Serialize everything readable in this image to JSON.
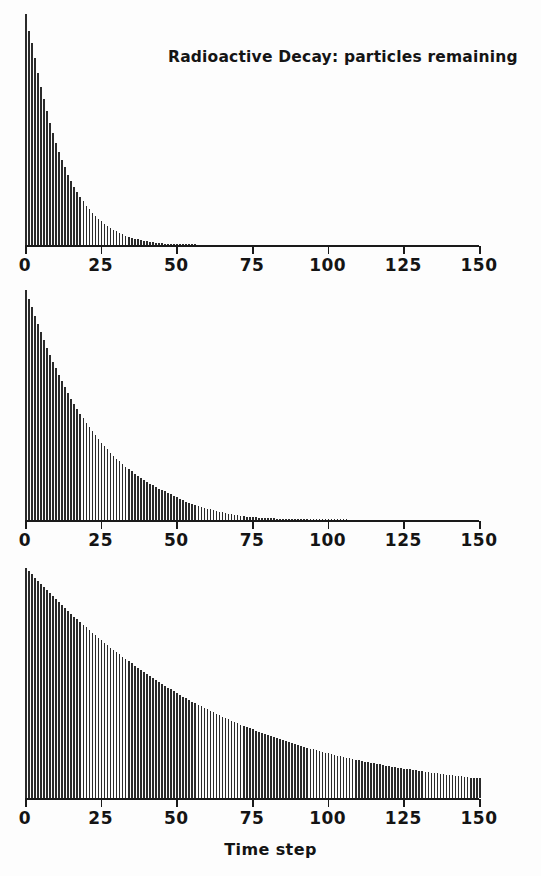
{
  "figure": {
    "title": "Radioactive Decay: particles remaining",
    "xlabel": "Time step",
    "background_color": "#fdfdfd",
    "ink_color": "#2b2b2b"
  },
  "axis": {
    "tick_labels": [
      "0",
      "25",
      "50",
      "75",
      "100",
      "125",
      "150"
    ],
    "tick_values": [
      0,
      25,
      50,
      75,
      100,
      125,
      150
    ]
  },
  "chart_data": {
    "type": "bar",
    "title": "Radioactive Decay: particles remaining",
    "xlabel": "Time step",
    "ylabel": "",
    "xlim": [
      0,
      150
    ],
    "grid": false,
    "legend": "none",
    "note": "Three stacked panels: three independent decay simulations with increasing half-life (fast, medium, slow). Each bar is the particle count remaining at that time step; y axis is unlabelled and each panel is autoscaled to its own initial count.",
    "panels": [
      {
        "name": "panel-fast-decay",
        "ylim": [
          0,
          1000
        ],
        "half_life_steps": 6,
        "x": [
          0,
          1,
          2,
          3,
          4,
          5,
          6,
          7,
          8,
          9,
          10,
          11,
          12,
          13,
          14,
          15,
          16,
          17,
          18,
          19,
          20,
          21,
          22,
          23,
          24,
          25,
          26,
          27,
          28,
          29,
          30,
          31,
          32,
          33,
          34,
          35,
          36,
          37,
          38,
          39,
          40,
          41,
          42,
          43,
          44,
          45,
          46,
          47,
          48,
          49,
          50,
          51,
          52,
          53,
          54,
          55,
          56,
          57,
          58,
          59,
          60,
          61,
          62,
          63,
          64,
          65,
          66,
          67,
          68,
          69,
          70,
          71,
          72,
          73,
          74,
          75,
          76,
          77,
          78,
          79,
          80,
          81,
          82,
          83,
          84,
          85,
          86,
          87,
          88,
          89,
          90,
          91,
          92,
          93,
          94,
          95,
          96,
          97,
          98,
          99,
          100,
          101,
          102,
          103,
          104,
          105,
          106,
          107,
          108,
          109,
          110,
          111,
          112,
          113,
          114,
          115,
          116,
          117,
          118,
          119,
          120,
          121,
          122,
          123,
          124,
          125,
          126,
          127,
          128,
          129,
          130,
          131,
          132,
          133,
          134,
          135,
          136,
          137,
          138,
          139,
          140,
          141,
          142,
          143,
          144,
          145,
          146,
          147,
          148,
          149,
          150
        ],
        "values": [
          1000,
          928,
          874,
          808,
          746,
          683,
          630,
          578,
          529,
          483,
          441,
          404,
          368,
          336,
          305,
          276,
          252,
          229,
          208,
          189,
          171,
          154,
          140,
          126,
          113,
          102,
          92,
          83,
          74,
          66,
          59,
          52,
          46,
          41,
          36,
          32,
          28,
          24,
          21,
          18,
          16,
          13,
          11,
          9,
          8,
          7,
          6,
          5,
          4,
          3,
          3,
          2,
          2,
          1,
          1,
          1,
          1,
          0,
          0,
          0,
          0,
          0,
          0,
          0,
          0,
          0,
          0,
          0,
          0,
          0,
          0,
          0,
          0,
          0,
          0,
          0,
          0,
          0,
          0,
          0,
          0,
          0,
          0,
          0,
          0,
          0,
          0,
          0,
          0,
          0,
          0,
          0,
          0,
          0,
          0,
          0,
          0,
          0,
          0,
          0,
          0,
          0,
          0,
          0,
          0,
          0,
          0,
          0,
          0,
          0,
          0,
          0,
          0,
          0,
          0,
          0,
          0,
          0,
          0,
          0,
          0,
          0,
          0,
          0,
          0,
          0,
          0,
          0,
          0,
          0,
          0,
          0,
          0,
          0,
          0,
          0,
          0,
          0,
          0,
          0,
          0,
          0,
          0,
          0,
          0,
          0
        ]
      },
      {
        "name": "panel-medium-decay",
        "ylim": [
          0,
          1000
        ],
        "half_life_steps": 12,
        "x": [
          0,
          1,
          2,
          3,
          4,
          5,
          6,
          7,
          8,
          9,
          10,
          11,
          12,
          13,
          14,
          15,
          16,
          17,
          18,
          19,
          20,
          21,
          22,
          23,
          24,
          25,
          26,
          27,
          28,
          29,
          30,
          31,
          32,
          33,
          34,
          35,
          36,
          37,
          38,
          39,
          40,
          41,
          42,
          43,
          44,
          45,
          46,
          47,
          48,
          49,
          50,
          51,
          52,
          53,
          54,
          55,
          56,
          57,
          58,
          59,
          60,
          61,
          62,
          63,
          64,
          65,
          66,
          67,
          68,
          69,
          70,
          71,
          72,
          73,
          74,
          75,
          76,
          77,
          78,
          79,
          80,
          81,
          82,
          83,
          84,
          85,
          86,
          87,
          88,
          89,
          90,
          91,
          92,
          93,
          94,
          95,
          96,
          97,
          98,
          99,
          100,
          101,
          102,
          103,
          104,
          105,
          106,
          107,
          108,
          109,
          110,
          111,
          112,
          113,
          114,
          115,
          116,
          117,
          118,
          119,
          120,
          121,
          122,
          123,
          124,
          125,
          126,
          127,
          128,
          129,
          130,
          131,
          132,
          133,
          134,
          135,
          136,
          137,
          138,
          139,
          140,
          141,
          142,
          143,
          144,
          145,
          146,
          147,
          148,
          149,
          150
        ],
        "values": [
          1000,
          962,
          927,
          888,
          852,
          818,
          784,
          750,
          717,
          688,
          660,
          632,
          604,
          578,
          553,
          528,
          506,
          484,
          463,
          442,
          423,
          404,
          386,
          369,
          352,
          336,
          321,
          307,
          293,
          280,
          267,
          255,
          243,
          232,
          221,
          211,
          201,
          192,
          183,
          175,
          166,
          158,
          151,
          144,
          137,
          130,
          124,
          118,
          112,
          106,
          100,
          93,
          86,
          80,
          74,
          69,
          64,
          60,
          56,
          52,
          49,
          46,
          43,
          40,
          37,
          34,
          31,
          28,
          25,
          22,
          20,
          18,
          16,
          14,
          13,
          12,
          11,
          10,
          9,
          8,
          8,
          7,
          7,
          6,
          6,
          5,
          5,
          5,
          4,
          4,
          4,
          3,
          3,
          3,
          3,
          2,
          2,
          2,
          2,
          1,
          1,
          1,
          1,
          1,
          1,
          1,
          1,
          0,
          0,
          0,
          0,
          0,
          0,
          0,
          0,
          0,
          0,
          0,
          0,
          0,
          0,
          0,
          0,
          0,
          0,
          0,
          0,
          0,
          0,
          0,
          0,
          0,
          0,
          0,
          0,
          0,
          0,
          0,
          0,
          0,
          0,
          0,
          0,
          0,
          0,
          0,
          0
        ]
      },
      {
        "name": "panel-slow-decay",
        "ylim": [
          0,
          1000
        ],
        "half_life_steps": 45,
        "x": [
          0,
          1,
          2,
          3,
          4,
          5,
          6,
          7,
          8,
          9,
          10,
          11,
          12,
          13,
          14,
          15,
          16,
          17,
          18,
          19,
          20,
          21,
          22,
          23,
          24,
          25,
          26,
          27,
          28,
          29,
          30,
          31,
          32,
          33,
          34,
          35,
          36,
          37,
          38,
          39,
          40,
          41,
          42,
          43,
          44,
          45,
          46,
          47,
          48,
          49,
          50,
          51,
          52,
          53,
          54,
          55,
          56,
          57,
          58,
          59,
          60,
          61,
          62,
          63,
          64,
          65,
          66,
          67,
          68,
          69,
          70,
          71,
          72,
          73,
          74,
          75,
          76,
          77,
          78,
          79,
          80,
          81,
          82,
          83,
          84,
          85,
          86,
          87,
          88,
          89,
          90,
          91,
          92,
          93,
          94,
          95,
          96,
          97,
          98,
          99,
          100,
          101,
          102,
          103,
          104,
          105,
          106,
          107,
          108,
          109,
          110,
          111,
          112,
          113,
          114,
          115,
          116,
          117,
          118,
          119,
          120,
          121,
          122,
          123,
          124,
          125,
          126,
          127,
          128,
          129,
          130,
          131,
          132,
          133,
          134,
          135,
          136,
          137,
          138,
          139,
          140,
          141,
          142,
          143,
          144,
          145,
          146,
          147,
          148,
          149,
          150
        ],
        "values": [
          1000,
          986,
          972,
          958,
          944,
          930,
          917,
          903,
          890,
          877,
          864,
          851,
          838,
          826,
          813,
          801,
          789,
          777,
          765,
          753,
          742,
          730,
          719,
          708,
          697,
          686,
          675,
          665,
          654,
          644,
          634,
          624,
          614,
          604,
          594,
          585,
          575,
          566,
          557,
          548,
          539,
          530,
          521,
          513,
          504,
          496,
          488,
          480,
          472,
          464,
          456,
          449,
          441,
          434,
          427,
          419,
          412,
          405,
          399,
          392,
          385,
          379,
          372,
          366,
          360,
          354,
          348,
          342,
          336,
          330,
          325,
          319,
          314,
          309,
          303,
          298,
          293,
          288,
          283,
          278,
          274,
          269,
          264,
          260,
          255,
          251,
          247,
          242,
          238,
          234,
          230,
          226,
          222,
          219,
          215,
          211,
          208,
          204,
          201,
          197,
          194,
          191,
          188,
          184,
          181,
          178,
          175,
          172,
          170,
          167,
          164,
          161,
          158,
          156,
          153,
          151,
          148,
          146,
          143,
          141,
          139,
          136,
          134,
          132,
          130,
          128,
          126,
          124,
          122,
          120,
          118,
          116,
          114,
          112,
          110,
          108,
          107,
          105,
          103,
          102,
          100,
          98,
          97,
          95,
          94,
          92,
          91,
          89,
          88,
          87,
          85
        ]
      }
    ]
  }
}
